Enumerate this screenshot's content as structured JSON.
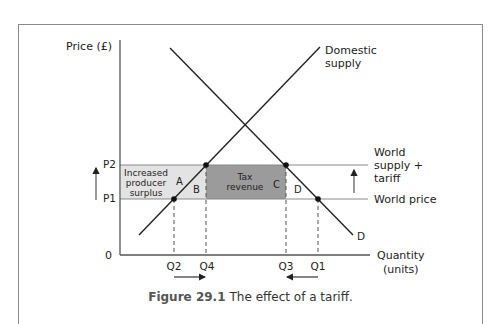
{
  "figure": {
    "number": "Figure 29.1",
    "title": "The effect of a tariff."
  },
  "axes": {
    "y_label": "Price (£)",
    "x_label_line1": "Quantity",
    "x_label_line2": "(units)",
    "origin": "0"
  },
  "prices": {
    "p2": "P2",
    "p1": "P1"
  },
  "quantities": {
    "q2": "Q2",
    "q4": "Q4",
    "q3": "Q3",
    "q1": "Q1"
  },
  "curves": {
    "supply_line1": "Domestic",
    "supply_line2": "supply",
    "demand": "D",
    "world_tariff_line1": "World",
    "world_tariff_line2": "supply +",
    "world_tariff_line3": "tariff",
    "world_price": "World price"
  },
  "regions": {
    "surplus_line1": "Increased",
    "surplus_line2": "producer",
    "surplus_line3": "surplus",
    "a": "A",
    "b": "B",
    "tax_line1": "Tax",
    "tax_line2": "revenue",
    "c": "C",
    "d": "D"
  },
  "colors": {
    "light_shade": "#e3e3e3",
    "dark_shade": "#9b9b9b",
    "line": "#222222",
    "guide": "#8a8a8a"
  }
}
